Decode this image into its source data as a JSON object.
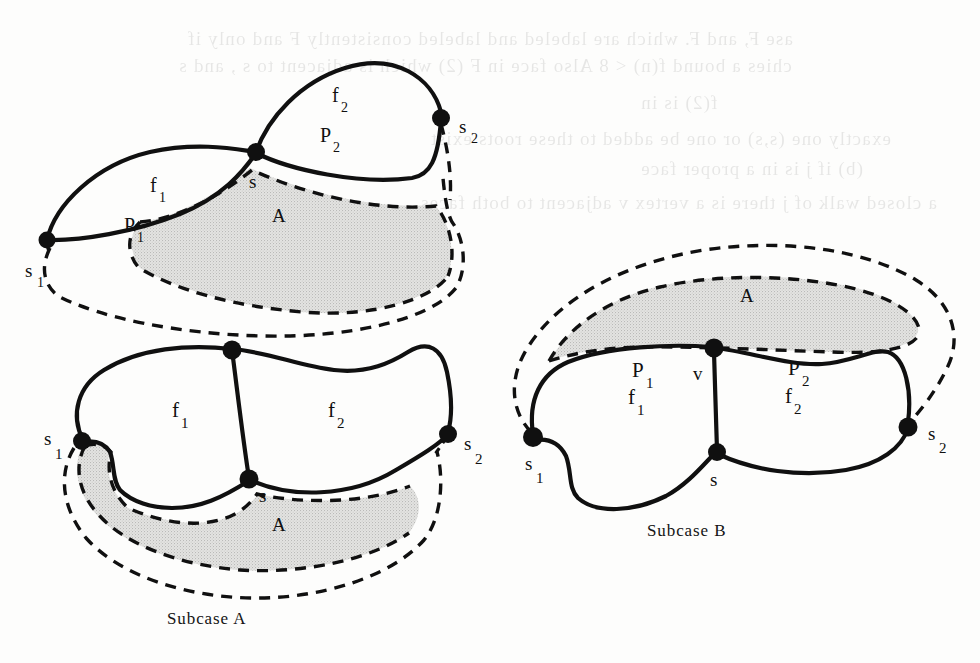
{
  "document": {
    "background_color": "#fdfdfc",
    "ink_color": "#101010",
    "shade_color": "#dcdcdc"
  },
  "ghost_text": {
    "note": "faint mirrored bleed-through text from reverse side of scanned page",
    "lines": [
      "ase  F, and  F. which are labeled and labeled consistently  F  and  only if",
      "chies a bound f(n) < 8 Also face in  F  (2) which is adjacent to  s , and  s",
      "f(2) is in",
      "exactly one (s,s) or one be added to these roots exist",
      "(b) if  j  is in  a  proper  face",
      "a closed walk of  j  there is a vertex  v  adjacent to both faces"
    ]
  },
  "figures": [
    {
      "id": "top-left-diagram",
      "caption": null,
      "node_labels": [
        {
          "name": "s1",
          "base": "s",
          "sub": "1"
        },
        {
          "name": "s",
          "base": "s",
          "sub": ""
        },
        {
          "name": "s2",
          "base": "s",
          "sub": "2"
        }
      ],
      "region_labels": [
        {
          "name": "f1",
          "base": "f",
          "sub": "1"
        },
        {
          "name": "f2",
          "base": "f",
          "sub": "2"
        },
        {
          "name": "P1",
          "base": "P",
          "sub": "1"
        },
        {
          "name": "P2",
          "base": "P",
          "sub": "2"
        },
        {
          "name": "A",
          "base": "A",
          "sub": ""
        }
      ]
    },
    {
      "id": "bottom-left-diagram",
      "caption": "Subcase  A",
      "node_labels": [
        {
          "name": "s1",
          "base": "s",
          "sub": "1"
        },
        {
          "name": "s",
          "base": "s",
          "sub": ""
        },
        {
          "name": "s2",
          "base": "s",
          "sub": "2"
        }
      ],
      "region_labels": [
        {
          "name": "f1",
          "base": "f",
          "sub": "1"
        },
        {
          "name": "f2",
          "base": "f",
          "sub": "2"
        },
        {
          "name": "A",
          "base": "A",
          "sub": ""
        }
      ]
    },
    {
      "id": "right-diagram",
      "caption": "Subcase  B",
      "node_labels": [
        {
          "name": "s1",
          "base": "s",
          "sub": "1"
        },
        {
          "name": "s",
          "base": "s",
          "sub": ""
        },
        {
          "name": "s2",
          "base": "s",
          "sub": "2"
        },
        {
          "name": "v",
          "base": "v",
          "sub": ""
        }
      ],
      "region_labels": [
        {
          "name": "f1",
          "base": "f",
          "sub": "1"
        },
        {
          "name": "f2",
          "base": "f",
          "sub": "2"
        },
        {
          "name": "P1",
          "base": "P",
          "sub": "1"
        },
        {
          "name": "P2",
          "base": "P",
          "sub": "2"
        },
        {
          "name": "A",
          "base": "A",
          "sub": ""
        }
      ]
    }
  ],
  "labels": {
    "top": {
      "s1": "s",
      "s1_sub": "1",
      "s": "s",
      "s2": "s",
      "s2_sub": "2",
      "f1": "f",
      "f1_sub": "1",
      "f2": "f",
      "f2_sub": "2",
      "P1": "P",
      "P1_sub": "1",
      "P2": "P",
      "P2_sub": "2",
      "A": "A"
    },
    "bottom_left": {
      "s1": "s",
      "s1_sub": "1",
      "s": "s",
      "s2": "s",
      "s2_sub": "2",
      "f1": "f",
      "f1_sub": "1",
      "f2": "f",
      "f2_sub": "2",
      "A": "A",
      "caption": "Subcase  A"
    },
    "right": {
      "s1": "s",
      "s1_sub": "1",
      "s": "s",
      "s2": "s",
      "s2_sub": "2",
      "v": "v",
      "f1": "f",
      "f1_sub": "1",
      "f2": "f",
      "f2_sub": "2",
      "P1": "P",
      "P1_sub": "1",
      "P2": "P",
      "P2_sub": "2",
      "A": "A",
      "caption": "Subcase  B"
    }
  }
}
